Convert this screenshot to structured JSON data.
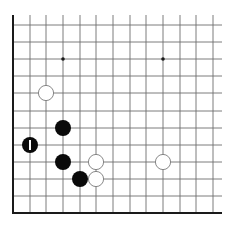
{
  "diagram": {
    "type": "go-board-fragment",
    "colors": {
      "background": "#ffffff",
      "grid_line": "#6e6e6e",
      "edge_line": "#1a1a1a",
      "black_stone": "#0a0a0a",
      "white_stone_fill": "#ffffff",
      "white_stone_stroke": "#7a7a7a",
      "marker": "#ffffff"
    },
    "grid": {
      "columns_x": [
        13,
        30,
        46,
        63,
        80,
        96,
        113,
        130,
        146,
        163,
        180,
        196,
        213
      ],
      "rows_y": [
        25,
        42,
        59,
        76,
        93,
        111,
        128,
        145,
        162,
        179,
        196,
        213
      ],
      "left_edge_x": 13,
      "bottom_edge_y": 213,
      "top_extent_y": 15,
      "right_extent_x": 222
    },
    "star_points": [
      {
        "col": 3,
        "row": 2
      },
      {
        "col": 9,
        "row": 2
      }
    ],
    "stones": [
      {
        "color": "white",
        "col": 2,
        "row": 4,
        "marker": ""
      },
      {
        "color": "black",
        "col": 3,
        "row": 6,
        "marker": ""
      },
      {
        "color": "black",
        "col": 1,
        "row": 7,
        "marker": "last-move-bar"
      },
      {
        "color": "black",
        "col": 3,
        "row": 8,
        "marker": ""
      },
      {
        "color": "white",
        "col": 5,
        "row": 8,
        "marker": ""
      },
      {
        "color": "black",
        "col": 4,
        "row": 9,
        "marker": ""
      },
      {
        "color": "white",
        "col": 5,
        "row": 9,
        "marker": ""
      },
      {
        "color": "white",
        "col": 9,
        "row": 8,
        "marker": ""
      }
    ],
    "stone_radius": 8
  }
}
